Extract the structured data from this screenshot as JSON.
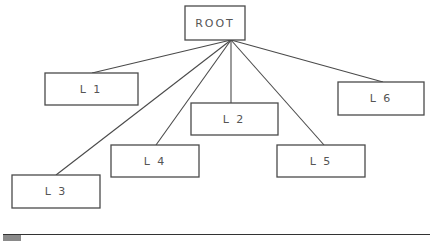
{
  "diagram": {
    "type": "tree",
    "root": {
      "id": "root",
      "label": "ROOT",
      "x": 185,
      "y": 6,
      "w": 60,
      "h": 34
    },
    "nodes": [
      {
        "id": "l1",
        "label": "L 1",
        "x": 45,
        "y": 73,
        "w": 93,
        "h": 32
      },
      {
        "id": "l2",
        "label": "L 2",
        "x": 191,
        "y": 103,
        "w": 87,
        "h": 32
      },
      {
        "id": "l3",
        "label": "L 3",
        "x": 12,
        "y": 175,
        "w": 88,
        "h": 33
      },
      {
        "id": "l4",
        "label": "L 4",
        "x": 111,
        "y": 145,
        "w": 88,
        "h": 32
      },
      {
        "id": "l5",
        "label": "L 5",
        "x": 277,
        "y": 145,
        "w": 88,
        "h": 32
      },
      {
        "id": "l6",
        "label": "L 6",
        "x": 338,
        "y": 82,
        "w": 86,
        "h": 33
      }
    ],
    "hub": {
      "x": 231,
      "y": 40
    },
    "edges": [
      {
        "to": "l1",
        "x2": 92,
        "y2": 73
      },
      {
        "to": "l2",
        "x2": 231,
        "y2": 103
      },
      {
        "to": "l3",
        "x2": 56,
        "y2": 175
      },
      {
        "to": "l4",
        "x2": 156,
        "y2": 145
      },
      {
        "to": "l5",
        "x2": 324,
        "y2": 145
      },
      {
        "to": "l6",
        "x2": 383,
        "y2": 82
      }
    ]
  }
}
